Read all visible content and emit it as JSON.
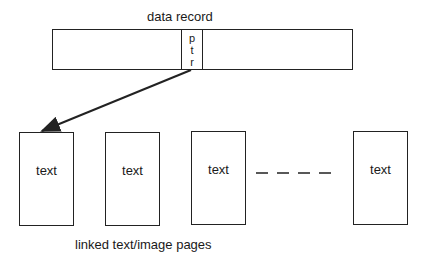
{
  "record": {
    "title": "data record",
    "pointer_chars": [
      "p",
      "t",
      "r"
    ]
  },
  "pages": [
    {
      "label": "text"
    },
    {
      "label": "text"
    },
    {
      "label": "text"
    },
    {
      "label": "text"
    }
  ],
  "ellipsis": "– – – –",
  "caption": "linked text/image pages",
  "colors": {
    "stroke": "#222222",
    "background": "#ffffff"
  }
}
